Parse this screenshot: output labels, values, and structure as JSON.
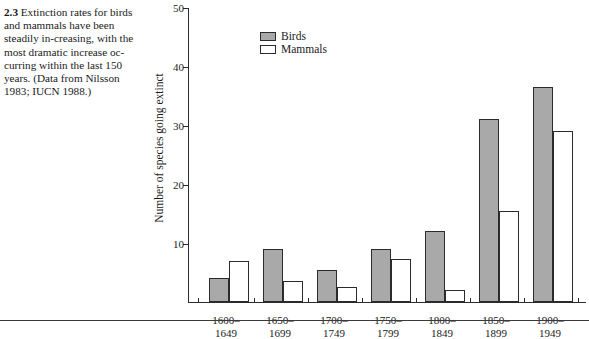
{
  "caption": {
    "figure_number": "2.3",
    "text": "Extinction rates for birds and mammals have been steadily in-creasing, with the most dramatic increase oc-curring within the last 150 years. (Data from Nilsson 1983; IUCN 1988.)"
  },
  "legend": {
    "position": "top-left-inside",
    "items": [
      {
        "label": "Birds",
        "swatch": "filled-gray-square",
        "color": "#a9a9a9"
      },
      {
        "label": "Mammals",
        "swatch": "hollow-white-square",
        "color": "#ffffff"
      }
    ]
  },
  "axes": {
    "y_title": "Number of species going extinct",
    "y_ticks": [
      "10",
      "20",
      "30",
      "40",
      "50"
    ],
    "x_title": ""
  },
  "chart_data": {
    "type": "bar",
    "title": "",
    "subtitle": "",
    "xlabel": "",
    "ylabel": "Number of species going extinct",
    "ylim": [
      0,
      50
    ],
    "yticks": [
      10,
      20,
      30,
      40,
      50
    ],
    "grid": false,
    "legend_position": "upper-left",
    "categories": [
      "1600–1649",
      "1650–1699",
      "1700–1749",
      "1750–1799",
      "1800–1849",
      "1850–1899",
      "1900–1949"
    ],
    "category_lines": [
      [
        "1600–",
        "1649"
      ],
      [
        "1650–",
        "1699"
      ],
      [
        "1700–",
        "1749"
      ],
      [
        "1750–",
        "1799"
      ],
      [
        "1800–",
        "1849"
      ],
      [
        "1850–",
        "1899"
      ],
      [
        "1900–",
        "1949"
      ]
    ],
    "series": [
      {
        "name": "Birds",
        "color": "#a9a9a9",
        "values": [
          4,
          9,
          5.5,
          9,
          12,
          31,
          36.5
        ]
      },
      {
        "name": "Mammals",
        "color": "#ffffff",
        "values": [
          7,
          3.5,
          2.5,
          7.3,
          2,
          15.5,
          29
        ]
      }
    ],
    "annotations": []
  },
  "colors": {
    "bar_fill_birds": "#a9a9a9",
    "bar_fill_mammals": "#ffffff",
    "bar_stroke": "#2b2b2b",
    "axis": "#2b2b2b",
    "text": "#1a1a1a",
    "background": "#ffffff"
  }
}
